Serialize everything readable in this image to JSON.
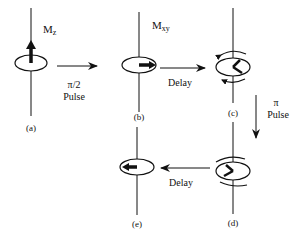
{
  "diagram": {
    "stages": [
      {
        "id": "a",
        "label": "(a)",
        "annotation_main": "M",
        "annotation_sub": "z"
      },
      {
        "id": "b",
        "label": "(b)",
        "annotation_main": "M",
        "annotation_sub": "xy"
      },
      {
        "id": "c",
        "label": "(c)"
      },
      {
        "id": "d",
        "label": "(d)"
      },
      {
        "id": "e",
        "label": "(e)"
      }
    ],
    "transitions": [
      {
        "from": "a",
        "to": "b",
        "line1": "π/2",
        "line2": "Pulse"
      },
      {
        "from": "b",
        "to": "c",
        "line1": "Delay"
      },
      {
        "from": "c",
        "to": "d",
        "line1": "π",
        "line2": "Pulse"
      },
      {
        "from": "d",
        "to": "e",
        "line1": "Delay"
      }
    ],
    "colors": {
      "ink": "#111111",
      "background": "#ffffff"
    }
  }
}
